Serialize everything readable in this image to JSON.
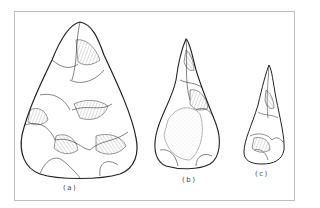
{
  "figure": {
    "items": [
      {
        "id": "a",
        "label": "(a)"
      },
      {
        "id": "b",
        "label": "(b)"
      },
      {
        "id": "c",
        "label": "(c)"
      }
    ],
    "colors": {
      "ink": "#222222",
      "frame": "#bdbdbd",
      "background": "#ffffff"
    }
  }
}
